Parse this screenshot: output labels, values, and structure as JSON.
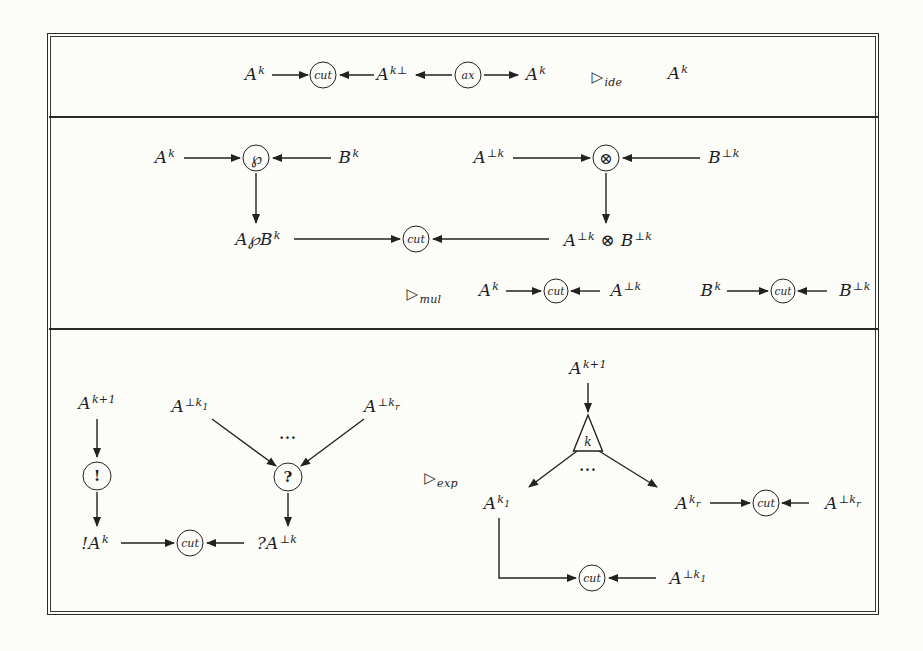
{
  "figure": {
    "ink": "#222222",
    "paper": "#fcfcf9"
  },
  "symbols": {
    "cut": "cut",
    "ax": "ax",
    "par": "℘",
    "tensor": "⊗",
    "ofcourse": "!",
    "whynot": "?",
    "box_k": "k",
    "dots": "..."
  },
  "rules": {
    "ide": [
      {
        "t": "▷"
      },
      {
        "t": "ide",
        "s": "sub"
      }
    ],
    "mul": [
      {
        "t": "▷"
      },
      {
        "t": "mul",
        "s": "sub"
      }
    ],
    "exp": [
      {
        "t": "▷"
      },
      {
        "t": "exp",
        "s": "sub"
      }
    ]
  },
  "labels": {
    "Ak": [
      {
        "t": "A"
      },
      {
        "t": "k",
        "s": "sup"
      }
    ],
    "Ak_perp": [
      {
        "t": "A"
      },
      {
        "t": "k⊥",
        "s": "sup"
      }
    ],
    "A_perp_k": [
      {
        "t": "A"
      },
      {
        "t": "⊥k",
        "s": "sup"
      }
    ],
    "Bk": [
      {
        "t": "B"
      },
      {
        "t": "k",
        "s": "sup"
      }
    ],
    "B_perp_k": [
      {
        "t": "B"
      },
      {
        "t": "⊥k",
        "s": "sup"
      }
    ],
    "AparB_k": [
      {
        "t": "A℘B"
      },
      {
        "t": "k",
        "s": "sup"
      }
    ],
    "Aperp_tensor_Bperp": [
      {
        "t": "A"
      },
      {
        "t": "⊥k",
        "s": "sup"
      },
      {
        "t": " ⊗ "
      },
      {
        "t": "B"
      },
      {
        "t": "⊥k",
        "s": "sup"
      }
    ],
    "Ak_plus1": [
      {
        "t": "A"
      },
      {
        "t": "k+1",
        "s": "sup"
      }
    ],
    "bang_Ak": [
      {
        "t": "!A"
      },
      {
        "t": "k",
        "s": "sup"
      }
    ],
    "quest_A_perp_k": [
      {
        "t": "?A"
      },
      {
        "t": "⊥k",
        "s": "sup"
      }
    ],
    "A_perp_k1": [
      {
        "t": "A"
      },
      {
        "t": "⊥k",
        "s": "sup"
      },
      {
        "t": "1",
        "s": "ssub"
      }
    ],
    "A_perp_kr": [
      {
        "t": "A"
      },
      {
        "t": "⊥k",
        "s": "sup"
      },
      {
        "t": "r",
        "s": "ssub"
      }
    ],
    "A_k1": [
      {
        "t": "A"
      },
      {
        "t": "k",
        "s": "sup"
      },
      {
        "t": "1",
        "s": "ssub"
      }
    ],
    "A_kr": [
      {
        "t": "A"
      },
      {
        "t": "k",
        "s": "sup"
      },
      {
        "t": "r",
        "s": "ssub"
      }
    ]
  }
}
